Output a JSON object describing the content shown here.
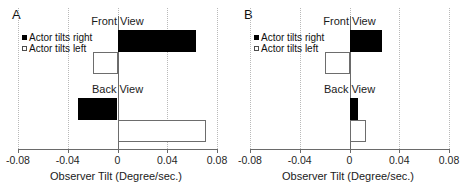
{
  "figure": {
    "panels": [
      {
        "id": "A",
        "label": "A",
        "axis_title": "Observer Tilt (Degree/sec.)",
        "legend": [
          {
            "key": "actor-tilts-right",
            "label": "Actor tilts right",
            "style": "filled",
            "color": "#000000"
          },
          {
            "key": "actor-tilts-left",
            "label": "Actor tilts left",
            "style": "open",
            "color": "#ffffff"
          }
        ],
        "groups": [
          {
            "key": "front-view",
            "title": "Front View"
          },
          {
            "key": "back-view",
            "title": "Back View"
          }
        ],
        "chart_data": {
          "type": "bar",
          "orientation": "horizontal",
          "title": "A",
          "xlabel": "Observer Tilt (Degree/sec.)",
          "ylabel": "",
          "xlim": [
            -0.08,
            0.08
          ],
          "xticks": [
            -0.08,
            -0.04,
            0,
            0.04,
            0.08
          ],
          "xticklabels": [
            "-0.08",
            "-0.04",
            "0",
            "0.04",
            "0.08"
          ],
          "grid": true,
          "grid_axis": "x",
          "legend_position": "upper-left",
          "categories": [
            "Front View",
            "Back View"
          ],
          "series": [
            {
              "name": "Actor tilts right",
              "values": [
                0.063,
                -0.032
              ]
            },
            {
              "name": "Actor tilts left",
              "values": [
                -0.02,
                0.071
              ]
            }
          ]
        }
      },
      {
        "id": "B",
        "label": "B",
        "axis_title": "Observer Tilt (Degree/sec.)",
        "legend": [
          {
            "key": "actor-tilts-right",
            "label": "Actor tilts right",
            "style": "filled",
            "color": "#000000"
          },
          {
            "key": "actor-tilts-left",
            "label": "Actor tilts left",
            "style": "open",
            "color": "#ffffff"
          }
        ],
        "groups": [
          {
            "key": "front-view",
            "title": "Front View"
          },
          {
            "key": "back-view",
            "title": "Back View"
          }
        ],
        "chart_data": {
          "type": "bar",
          "orientation": "horizontal",
          "title": "B",
          "xlabel": "Observer Tilt (Degree/sec.)",
          "ylabel": "",
          "xlim": [
            -0.08,
            0.08
          ],
          "xticks": [
            -0.08,
            -0.04,
            0,
            0.04,
            0.08
          ],
          "xticklabels": [
            "-0.08",
            "-0.04",
            "0",
            "0.04",
            "0.08"
          ],
          "grid": true,
          "grid_axis": "x",
          "legend_position": "upper-left",
          "categories": [
            "Front View",
            "Back View"
          ],
          "series": [
            {
              "name": "Actor tilts right",
              "values": [
                0.026,
                0.007
              ]
            },
            {
              "name": "Actor tilts left",
              "values": [
                -0.02,
                0.013
              ]
            }
          ]
        }
      }
    ]
  },
  "chart_data": [
    {
      "type": "bar",
      "orientation": "horizontal",
      "panel": "A",
      "title": "A",
      "xlabel": "Observer Tilt (Degree/sec.)",
      "xlim": [
        -0.08,
        0.08
      ],
      "xticks": [
        -0.08,
        -0.04,
        0,
        0.04,
        0.08
      ],
      "categories": [
        "Front View",
        "Back View"
      ],
      "series": [
        {
          "name": "Actor tilts right",
          "values": [
            0.063,
            -0.032
          ]
        },
        {
          "name": "Actor tilts left",
          "values": [
            -0.02,
            0.071
          ]
        }
      ]
    },
    {
      "type": "bar",
      "orientation": "horizontal",
      "panel": "B",
      "title": "B",
      "xlabel": "Observer Tilt (Degree/sec.)",
      "xlim": [
        -0.08,
        0.08
      ],
      "xticks": [
        -0.08,
        -0.04,
        0,
        0.04,
        0.08
      ],
      "categories": [
        "Front View",
        "Back View"
      ],
      "series": [
        {
          "name": "Actor tilts right",
          "values": [
            0.026,
            0.007
          ]
        },
        {
          "name": "Actor tilts left",
          "values": [
            -0.02,
            0.013
          ]
        }
      ]
    }
  ]
}
